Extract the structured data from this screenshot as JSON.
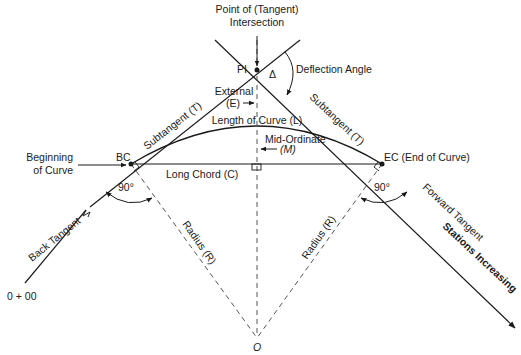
{
  "diagram": {
    "colors": {
      "line": "#1a1a1a",
      "dashed": "#555555",
      "background": "#ffffff"
    },
    "points": {
      "pi": {
        "label": "PI",
        "x": 257,
        "y": 70
      },
      "bc": {
        "label": "BC",
        "x": 131,
        "y": 164
      },
      "ec": {
        "label": "EC (End of Curve)",
        "x": 382,
        "y": 164
      },
      "o": {
        "label": "O",
        "x": 257,
        "y": 338
      }
    },
    "labels": {
      "pi_title_1": "Point of (Tangent)",
      "pi_title_2": "Intersection",
      "deflection_symbol": "Δ",
      "deflection_angle": "Deflection Angle",
      "external_1": "External",
      "external_2": "(E)",
      "subtangent_left": "Subtangent (T)",
      "subtangent_right": "Subtangent (T)",
      "length_of_curve": "Length of Curve (L)",
      "mid_ordinate_1": "Mid-Ordinate",
      "mid_ordinate_2": "(M)",
      "beginning_1": "Beginning",
      "beginning_2": "of Curve",
      "long_chord": "Long Chord (C)",
      "angle_left": "90°",
      "angle_right": "90°",
      "radius_left": "Radius (R)",
      "radius_right": "Radius (R)",
      "back_tangent": "Back Tangent",
      "forward_tangent": "Forward Tangent",
      "stations_increasing": "Stations Increasing",
      "station_start": "0 + 00",
      "center": "O"
    }
  }
}
